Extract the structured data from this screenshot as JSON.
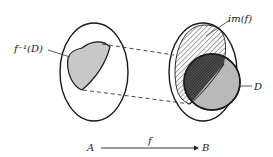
{
  "diagram": {
    "labels": {
      "preimage": "f⁻¹(D)",
      "image": "im(f)",
      "subset": "D",
      "domain": "A",
      "codomain": "B",
      "function": "f"
    },
    "colors": {
      "outline": "#1a1a1a",
      "preimage_fill": "#c8c8c8",
      "subset_fill": "#b9b9b9",
      "hatch": "#333333",
      "background": "#ffffff"
    },
    "elements": [
      {
        "name": "set-A",
        "shape": "ellipse"
      },
      {
        "name": "set-B",
        "shape": "ellipse"
      },
      {
        "name": "preimage-region",
        "shape": "shaded-lens"
      },
      {
        "name": "image-region",
        "shape": "hatched-ellipse"
      },
      {
        "name": "subset-D",
        "shape": "shaded-circle"
      },
      {
        "name": "intersection",
        "shape": "dense-hatch"
      },
      {
        "name": "mapping-lines",
        "shape": "dashed-lines"
      },
      {
        "name": "function-arrow",
        "shape": "arrow"
      }
    ]
  }
}
